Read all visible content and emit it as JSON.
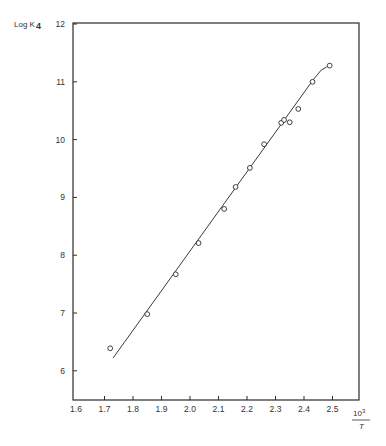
{
  "chart_data": {
    "type": "scatter",
    "title": "",
    "ylabel": "Log K4",
    "ylabel_main": "Log K",
    "ylabel_sub": "4",
    "xlabel": "10^3 / T",
    "xlabel_num": "10",
    "xlabel_exp": "3",
    "xlabel_den": "T",
    "xlim": [
      1.6,
      2.6
    ],
    "ylim": [
      5.45,
      12
    ],
    "xticks": [
      1.6,
      1.7,
      1.8,
      1.9,
      2.0,
      2.1,
      2.2,
      2.3,
      2.4,
      2.5
    ],
    "xtick_labels": [
      "1.6",
      "1.7",
      "1.8",
      "1.9",
      "2.0",
      "2.1",
      "2.2",
      "2.3",
      "2.4",
      "2.5"
    ],
    "yticks": [
      6,
      7,
      8,
      9,
      10,
      11,
      12
    ],
    "ytick_labels": [
      "6",
      "7",
      "8",
      "9",
      "10",
      "11",
      "12"
    ],
    "grid": false,
    "legend": null,
    "series": [
      {
        "name": "measured",
        "marker": "open-circle",
        "x": [
          1.72,
          1.85,
          1.95,
          2.03,
          2.12,
          2.16,
          2.21,
          2.26,
          2.32,
          2.33,
          2.35,
          2.38,
          2.43,
          2.49
        ],
        "y": [
          6.39,
          6.98,
          7.67,
          8.21,
          8.8,
          9.18,
          9.51,
          9.92,
          10.29,
          10.34,
          10.3,
          10.53,
          11.0,
          11.28
        ]
      },
      {
        "name": "fit",
        "style": "line",
        "x": [
          1.73,
          2.43,
          2.46,
          2.48
        ],
        "y": [
          6.22,
          11.02,
          11.2,
          11.26
        ]
      }
    ]
  }
}
